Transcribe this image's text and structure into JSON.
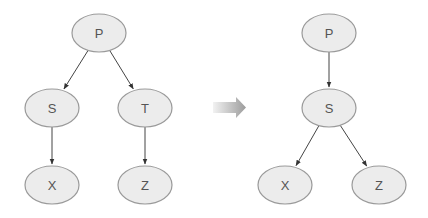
{
  "diagrams": [
    {
      "name": "before",
      "nodes": [
        {
          "id": "P",
          "label": "P"
        },
        {
          "id": "S",
          "label": "S"
        },
        {
          "id": "T",
          "label": "T"
        },
        {
          "id": "X",
          "label": "X"
        },
        {
          "id": "Z",
          "label": "Z"
        }
      ],
      "edges": [
        {
          "from": "P",
          "to": "S"
        },
        {
          "from": "P",
          "to": "T"
        },
        {
          "from": "S",
          "to": "X"
        },
        {
          "from": "T",
          "to": "Z"
        }
      ]
    },
    {
      "name": "after",
      "nodes": [
        {
          "id": "P",
          "label": "P"
        },
        {
          "id": "S",
          "label": "S"
        },
        {
          "id": "X",
          "label": "X"
        },
        {
          "id": "Z",
          "label": "Z"
        }
      ],
      "edges": [
        {
          "from": "P",
          "to": "S"
        },
        {
          "from": "S",
          "to": "X"
        },
        {
          "from": "S",
          "to": "Z"
        }
      ]
    }
  ],
  "transition_icon": "right-arrow-icon",
  "colors": {
    "node_fill": "#ececec",
    "node_stroke": "#9a9a9a",
    "edge": "#444444",
    "label": "#555555"
  }
}
